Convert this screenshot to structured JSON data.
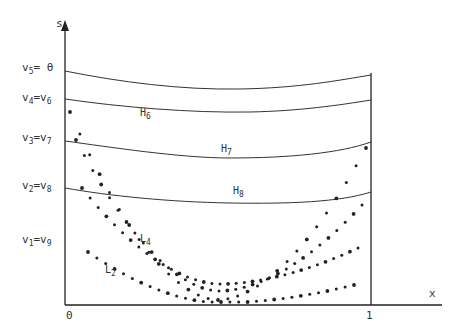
{
  "diagram": {
    "axes": {
      "y_label": "s",
      "x_label": "x",
      "x_ticks": [
        {
          "label": "0",
          "x": 0
        },
        {
          "label": "1",
          "x": 1
        }
      ]
    },
    "level_labels": [
      {
        "left": "v",
        "left_sub": "5",
        "eq": "=",
        "right": "θ",
        "right_sub": "",
        "y": 73
      },
      {
        "left": "v",
        "left_sub": "4",
        "eq": "=",
        "right": "v",
        "right_sub": "6",
        "y": 101
      },
      {
        "left": "v",
        "left_sub": "3",
        "eq": "=",
        "right": "v",
        "right_sub": "7",
        "y": 142
      },
      {
        "left": "v",
        "left_sub": "2",
        "eq": "=",
        "right": "v",
        "right_sub": "8",
        "y": 188
      },
      {
        "left": "v",
        "left_sub": "1",
        "eq": "=",
        "right": "v",
        "right_sub": "9",
        "y": 240
      }
    ],
    "level_curves": [
      {
        "name": "top",
        "label": "",
        "sub": ""
      },
      {
        "name": "H6",
        "label": "H",
        "sub": "6"
      },
      {
        "name": "H7",
        "label": "H",
        "sub": "7"
      },
      {
        "name": "H8",
        "label": "H",
        "sub": "8"
      }
    ],
    "dotted_curves": [
      {
        "label": "L",
        "sub": "4"
      },
      {
        "label": "L",
        "sub": "2"
      }
    ],
    "colors": {
      "ink": "#222222",
      "background": "#ffffff"
    }
  }
}
